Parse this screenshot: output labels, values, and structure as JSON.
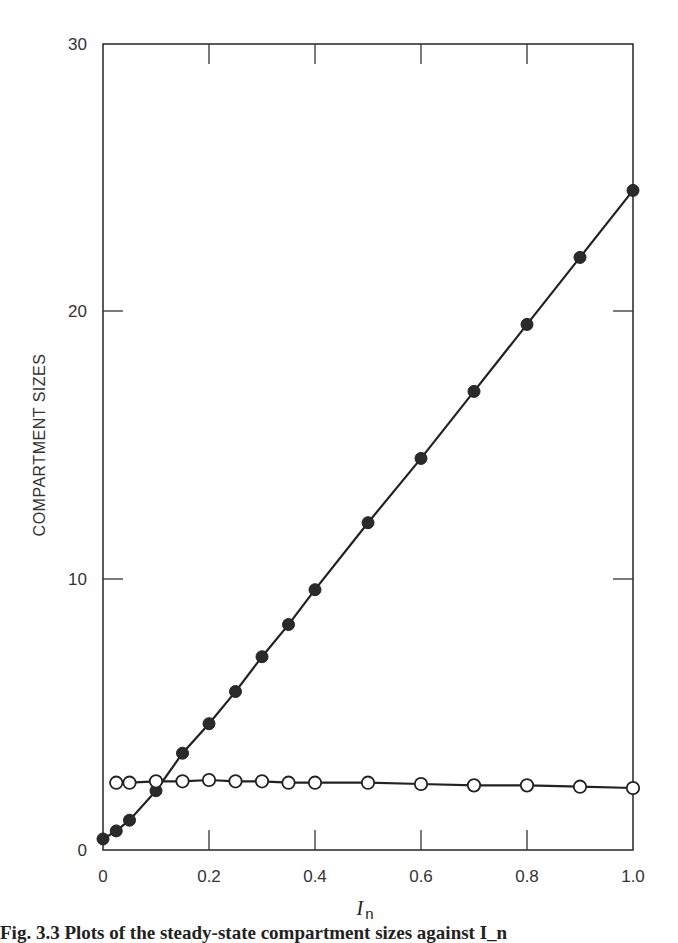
{
  "chart_data": {
    "type": "line",
    "title": "",
    "xlabel": "I_n",
    "xlabel_main": "I",
    "xlabel_sub": "n",
    "ylabel": "COMPARTMENT SIZES",
    "xlim": [
      0,
      1.0
    ],
    "ylim": [
      0,
      30
    ],
    "x_ticks": [
      "0",
      "0.2",
      "0.4",
      "0.6",
      "0.8",
      "1.0"
    ],
    "y_ticks": [
      "0",
      "10",
      "20",
      "30"
    ],
    "grid": false,
    "legend": null,
    "series": [
      {
        "name": "filled circles",
        "marker": "filled-circle",
        "x": [
          0,
          0.025,
          0.05,
          0.1,
          0.15,
          0.2,
          0.25,
          0.3,
          0.35,
          0.4,
          0.5,
          0.6,
          0.7,
          0.8,
          0.9,
          1.0
        ],
        "y": [
          0.3,
          0.6,
          1.0,
          2.1,
          3.5,
          4.6,
          5.8,
          7.1,
          8.3,
          9.6,
          12.1,
          14.5,
          17.0,
          19.5,
          22.0,
          24.5
        ]
      },
      {
        "name": "open circles",
        "marker": "open-circle",
        "x": [
          0.025,
          0.05,
          0.1,
          0.15,
          0.2,
          0.25,
          0.3,
          0.35,
          0.4,
          0.5,
          0.6,
          0.7,
          0.8,
          0.9,
          1.0
        ],
        "y": [
          2.4,
          2.4,
          2.45,
          2.45,
          2.5,
          2.45,
          2.45,
          2.4,
          2.4,
          2.4,
          2.35,
          2.3,
          2.3,
          2.25,
          2.2
        ]
      }
    ]
  },
  "caption": {
    "text": "Fig. 3.3 Plots of the steady-state compartment sizes against I_n"
  }
}
